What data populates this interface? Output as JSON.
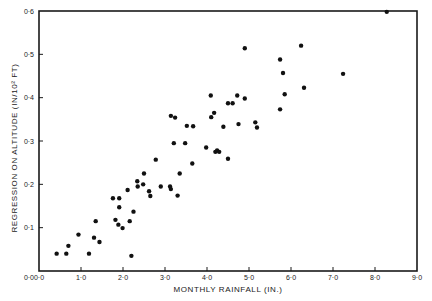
{
  "chart_data": {
    "type": "scatter",
    "title": "",
    "xlabel": "MONTHLY RAINFALL (IN.)",
    "ylabel": "REGRESSION ON ALTITUDE (IN/10² FT)",
    "xlim": [
      0,
      9
    ],
    "ylim": [
      0,
      0.6
    ],
    "xticks": [
      0,
      1,
      2,
      3,
      4,
      5,
      6,
      7,
      8,
      9
    ],
    "xtick_labels": [
      "0·0",
      "1·0",
      "2·0",
      "3·0",
      "4·0",
      "5·0",
      "6·0",
      "7·0",
      "8·0",
      "9·0"
    ],
    "yticks": [
      0,
      0.1,
      0.2,
      0.3,
      0.4,
      0.5,
      0.6
    ],
    "ytick_labels": [
      "0·0",
      "0·1",
      "0·2",
      "0·3",
      "0·4",
      "0·5",
      "0·6"
    ],
    "grid": false,
    "legend": null,
    "marker_color": "#111111",
    "frame_color": "#1a1a1a",
    "points": [
      [
        0.42,
        0.04
      ],
      [
        0.65,
        0.04
      ],
      [
        0.7,
        0.058
      ],
      [
        0.94,
        0.084
      ],
      [
        1.19,
        0.04
      ],
      [
        1.31,
        0.077
      ],
      [
        1.35,
        0.115
      ],
      [
        1.44,
        0.067
      ],
      [
        1.76,
        0.168
      ],
      [
        1.91,
        0.168
      ],
      [
        1.91,
        0.147
      ],
      [
        1.82,
        0.118
      ],
      [
        1.89,
        0.107
      ],
      [
        1.99,
        0.099
      ],
      [
        2.11,
        0.187
      ],
      [
        2.16,
        0.115
      ],
      [
        2.25,
        0.137
      ],
      [
        2.2,
        0.035
      ],
      [
        2.34,
        0.207
      ],
      [
        2.35,
        0.195
      ],
      [
        2.5,
        0.225
      ],
      [
        2.48,
        0.2
      ],
      [
        2.62,
        0.184
      ],
      [
        2.65,
        0.173
      ],
      [
        2.78,
        0.257
      ],
      [
        2.9,
        0.195
      ],
      [
        3.12,
        0.195
      ],
      [
        3.14,
        0.189
      ],
      [
        3.3,
        0.174
      ],
      [
        3.35,
        0.225
      ],
      [
        3.65,
        0.248
      ],
      [
        3.14,
        0.358
      ],
      [
        3.24,
        0.354
      ],
      [
        3.52,
        0.335
      ],
      [
        3.67,
        0.334
      ],
      [
        3.21,
        0.295
      ],
      [
        3.48,
        0.295
      ],
      [
        4.09,
        0.405
      ],
      [
        4.17,
        0.365
      ],
      [
        4.1,
        0.355
      ],
      [
        3.98,
        0.285
      ],
      [
        4.2,
        0.275
      ],
      [
        4.24,
        0.278
      ],
      [
        4.29,
        0.275
      ],
      [
        4.39,
        0.333
      ],
      [
        4.5,
        0.259
      ],
      [
        4.5,
        0.387
      ],
      [
        4.61,
        0.387
      ],
      [
        4.72,
        0.405
      ],
      [
        4.9,
        0.398
      ],
      [
        4.75,
        0.339
      ],
      [
        5.15,
        0.343
      ],
      [
        5.19,
        0.331
      ],
      [
        4.9,
        0.514
      ],
      [
        6.24,
        0.52
      ],
      [
        5.74,
        0.488
      ],
      [
        5.81,
        0.457
      ],
      [
        6.31,
        0.423
      ],
      [
        5.85,
        0.408
      ],
      [
        5.74,
        0.373
      ],
      [
        8.28,
        0.598
      ],
      [
        7.24,
        0.455
      ]
    ]
  }
}
